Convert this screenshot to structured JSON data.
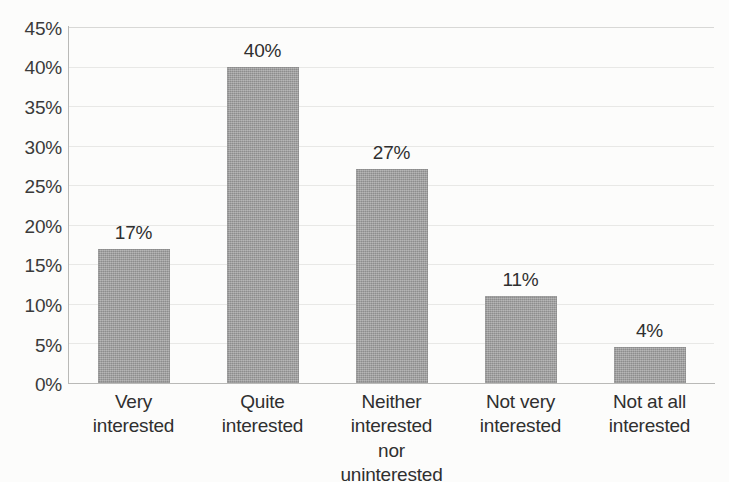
{
  "chart_data": {
    "type": "bar",
    "title": "",
    "subtitle": "",
    "xlabel": "",
    "ylabel": "",
    "categories": [
      "Very\ninterested",
      "Quite\ninterested",
      "Neither\ninterested\nnor\nuninterested",
      "Not very\ninterested",
      "Not at all\ninterested"
    ],
    "values": [
      17,
      40,
      27,
      11,
      4
    ],
    "data_labels": [
      "17%",
      "40%",
      "27%",
      "11%",
      "4%"
    ],
    "ylim": [
      0,
      45
    ],
    "ytick_step": 5,
    "ytick_labels": [
      "0%",
      "5%",
      "10%",
      "15%",
      "20%",
      "25%",
      "30%",
      "35%",
      "40%",
      "45%"
    ],
    "ytick_values": [
      0,
      5,
      10,
      15,
      20,
      25,
      30,
      35,
      40,
      45
    ],
    "grid": true,
    "grid_axis": "y",
    "legend": false,
    "legend_position": "none",
    "bar_color": "#9b9b9b",
    "axis_color": "#b9b9b7",
    "gridline_color": "#e8e8e6",
    "text_color": "#2f2f2f",
    "background_color": "#fcfcfb"
  }
}
